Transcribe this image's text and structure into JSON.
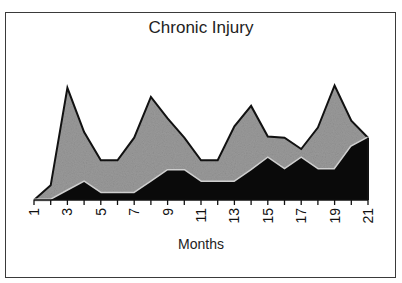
{
  "chart_data": {
    "type": "area",
    "stacked": false,
    "title": "Chronic Injury",
    "xlabel": "Months",
    "ylabel": "",
    "x": [
      1,
      2,
      3,
      4,
      5,
      6,
      7,
      8,
      9,
      10,
      11,
      12,
      13,
      14,
      15,
      16,
      17,
      18,
      19,
      20,
      21
    ],
    "tick_labels": [
      "1",
      "3",
      "5",
      "7",
      "9",
      "11",
      "13",
      "15",
      "17",
      "19",
      "21"
    ],
    "series": [
      {
        "name": "upper (light gray)",
        "color": "#9a9a9a",
        "values": [
          0,
          13,
          99,
          60,
          35,
          35,
          55,
          91,
          72,
          55,
          35,
          35,
          65,
          83,
          56,
          55,
          45,
          64,
          101,
          70,
          55
        ]
      },
      {
        "name": "lower (black)",
        "color": "#0a0a0a",
        "values": [
          0,
          0,
          8,
          16,
          6,
          6,
          6,
          16,
          26,
          26,
          16,
          16,
          16,
          26,
          37,
          27,
          37,
          27,
          27,
          47,
          55
        ]
      }
    ],
    "ylim": [
      0,
      120
    ],
    "grid": false,
    "legend": "none",
    "y_axis_visible": false
  }
}
